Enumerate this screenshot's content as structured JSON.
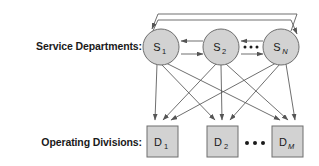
{
  "diagram": {
    "title_text": "Service department and operating division cost allocation diagram",
    "rows": [
      {
        "id": "service-departments",
        "label": "Service Departments:",
        "shape": "circle",
        "nodes": [
          {
            "id": "s1",
            "base": "S",
            "sub": "1",
            "sub_style": "normal",
            "cx": 161,
            "cy": 47,
            "r": 18
          },
          {
            "id": "s2",
            "base": "S",
            "sub": "2",
            "sub_style": "normal",
            "cx": 221,
            "cy": 47,
            "r": 18
          },
          {
            "id": "sn",
            "base": "S",
            "sub": "N",
            "sub_style": "italic",
            "cx": 281,
            "cy": 47,
            "r": 18
          }
        ],
        "ellipsis": {
          "between": "s2-sn",
          "cx": 251,
          "cy": 45,
          "dots": 3
        }
      },
      {
        "id": "operating-divisions",
        "label": "Operating Divisions:",
        "shape": "square",
        "nodes": [
          {
            "id": "d1",
            "base": "D",
            "sub": "1",
            "sub_style": "normal",
            "x": 147,
            "y": 126,
            "w": 31,
            "h": 31
          },
          {
            "id": "d2",
            "base": "D",
            "sub": "2",
            "sub_style": "normal",
            "x": 207,
            "y": 126,
            "w": 31,
            "h": 31
          },
          {
            "id": "dm",
            "base": "D",
            "sub": "M",
            "sub_style": "italic",
            "x": 272,
            "y": 126,
            "w": 31,
            "h": 31
          }
        ],
        "ellipsis": {
          "between": "d2-dm",
          "cx": 255,
          "cy": 143,
          "dots": 3
        }
      }
    ],
    "edges": {
      "feedback_arcs": [
        {
          "id": "arc-sn-to-s1",
          "from": "sn",
          "to": "s1",
          "apex_y": 13,
          "direction": "right-to-left"
        },
        {
          "id": "arc-s1-to-sn",
          "from": "s1",
          "to": "sn",
          "apex_y": 19,
          "direction": "left-to-right"
        }
      ],
      "lateral": [
        {
          "id": "s2-to-s1",
          "from": "s2",
          "to": "s1",
          "y": 42,
          "direction": "left"
        },
        {
          "id": "s1-to-s2",
          "from": "s1",
          "to": "s2",
          "y": 54,
          "direction": "right"
        },
        {
          "id": "sn-to-s2",
          "from": "sn",
          "to": "s2",
          "y": 42,
          "direction": "left"
        },
        {
          "id": "s2-to-sn",
          "from": "s2",
          "to": "sn",
          "y": 54,
          "direction": "right"
        }
      ],
      "allocations": [
        {
          "from": "s1",
          "to": "d1"
        },
        {
          "from": "s1",
          "to": "d2"
        },
        {
          "from": "s1",
          "to": "dm"
        },
        {
          "from": "s2",
          "to": "d1"
        },
        {
          "from": "s2",
          "to": "d2"
        },
        {
          "from": "s2",
          "to": "dm"
        },
        {
          "from": "sn",
          "to": "d1"
        },
        {
          "from": "sn",
          "to": "d2"
        },
        {
          "from": "sn",
          "to": "dm"
        }
      ]
    },
    "colors": {
      "node_fill": "#d2d2d2",
      "node_stroke": "#6e6e6e",
      "edge_stroke": "#555555",
      "text": "#1a1a1a",
      "background": "#ffffff"
    }
  }
}
